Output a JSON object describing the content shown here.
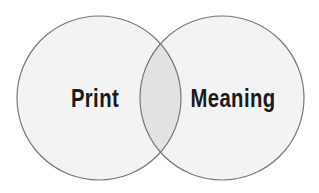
{
  "diagram": {
    "type": "venn",
    "sets": [
      {
        "id": "left",
        "label": "Print"
      },
      {
        "id": "right",
        "label": "Meaning"
      }
    ],
    "colors": {
      "background": "#ffffff",
      "circle_fill": "#f3f3f3",
      "overlap_fill": "#e2e2e2",
      "stroke": "#777777",
      "text": "#1a1a1a"
    }
  }
}
